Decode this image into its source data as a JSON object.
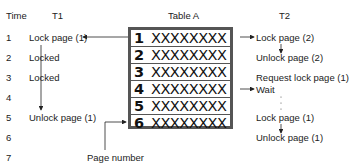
{
  "headers": {
    "time": "Time",
    "t1": "T1",
    "table": "Table A",
    "t2": "T2"
  },
  "time_steps": [
    "1",
    "2",
    "3",
    "4",
    "5",
    "6",
    "7"
  ],
  "t1_events": [
    {
      "step": 1,
      "label": "Lock page (1)"
    },
    {
      "step": 2,
      "label": "Locked"
    },
    {
      "step": 3,
      "label": "Locked"
    },
    {
      "step": 5,
      "label": "Unlock page (1)"
    }
  ],
  "table_rows": [
    {
      "page": "1",
      "data": "XXXXXXXX"
    },
    {
      "page": "2",
      "data": "XXXXXXXX"
    },
    {
      "page": "3",
      "data": "XXXXXXXX"
    },
    {
      "page": "4",
      "data": "XXXXXXXX"
    },
    {
      "page": "5",
      "data": "XXXXXXXX"
    },
    {
      "page": "6",
      "data": "XXXXXXXX"
    }
  ],
  "t2_events": [
    {
      "label": "Lock page (2)"
    },
    {
      "label": "Unlock page (2)"
    },
    {
      "label": "Request lock page (1)"
    },
    {
      "label": "Wait"
    },
    {
      "label": "Lock page (1)"
    },
    {
      "label": "Unlock page (1)"
    }
  ],
  "annotation": "Page number"
}
